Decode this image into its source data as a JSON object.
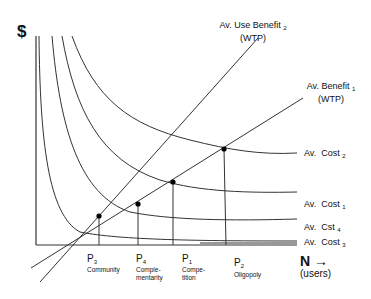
{
  "diagram": {
    "y_axis_label": "$",
    "x_axis_label": "N →",
    "x_axis_sublabel": "(users)",
    "benefit_lines": [
      {
        "name": "Av. Use Benefit",
        "subscript": "2",
        "line2": "(WTP)"
      },
      {
        "name": "Av. Benefit",
        "subscript": "1",
        "line2": "(WTP)"
      }
    ],
    "cost_curves": [
      {
        "name": "Av.  Cost",
        "subscript": "2"
      },
      {
        "name": "Av.  Cost",
        "subscript": "1"
      },
      {
        "name": "Av.  Cst",
        "subscript": "4"
      },
      {
        "name": "Av.  Cost",
        "subscript": "3"
      }
    ],
    "points": [
      {
        "label": "P",
        "subscript": "3",
        "desc_line1": "Community",
        "desc_line2": ""
      },
      {
        "label": "P",
        "subscript": "4",
        "desc_line1": "Comple-",
        "desc_line2": "mentarity"
      },
      {
        "label": "P",
        "subscript": "1",
        "desc_line1": "Compe-",
        "desc_line2": "tition"
      },
      {
        "label": "P",
        "subscript": "2",
        "desc_line1": "Oligopoly",
        "desc_line2": ""
      }
    ],
    "colors": {
      "line": "#333333",
      "background": "#ffffff"
    }
  }
}
